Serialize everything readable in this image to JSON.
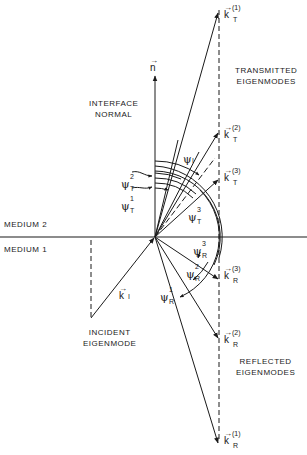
{
  "labels": {
    "interface_normal": [
      "INTERFACE",
      "NORMAL"
    ],
    "transmitted": [
      "TRANSMITTED",
      "EIGENMODES"
    ],
    "reflected": [
      "REFLECTED",
      "EIGENMODES"
    ],
    "incident": [
      "INCIDENT",
      "EIGENMODE"
    ],
    "medium2": "MEDIUM 2",
    "medium1": "MEDIUM 1"
  },
  "vectors": {
    "n": {
      "base": "n",
      "arrow": "→"
    },
    "kT1": {
      "base": "k",
      "arrow": "→",
      "sup": "(1)",
      "sub": "T"
    },
    "kT2": {
      "base": "k",
      "arrow": "→",
      "sup": "(2)",
      "sub": "T"
    },
    "kT3": {
      "base": "k",
      "arrow": "→",
      "sup": "(3)",
      "sub": "T"
    },
    "kR3": {
      "base": "k",
      "arrow": "→",
      "sup": "(3)",
      "sub": "R"
    },
    "kR2": {
      "base": "k",
      "arrow": "→",
      "sup": "(2)",
      "sub": "R"
    },
    "kR1": {
      "base": "k",
      "arrow": "→",
      "sup": "(1)",
      "sub": "R"
    },
    "kI": {
      "base": "k",
      "arrow": "→",
      "sub": "I"
    }
  },
  "angles": {
    "psiI": {
      "base": "ψ",
      "sub": "I"
    },
    "psiT1": {
      "base": "ψ",
      "sup": "1",
      "sub": "T"
    },
    "psiT2": {
      "base": "ψ",
      "sup": "2",
      "sub": "T"
    },
    "psiT3": {
      "base": "ψ",
      "sup": "3",
      "sub": "T"
    },
    "psiR1": {
      "base": "ψ",
      "sup": "1",
      "sub": "R"
    },
    "psiR2": {
      "base": "ψ",
      "sup": "2",
      "sub": "R"
    },
    "psiR3": {
      "base": "ψ",
      "sup": "3",
      "sub": "R"
    }
  },
  "colors": {
    "ink": "#1a1a1a",
    "background": "#ffffff"
  }
}
